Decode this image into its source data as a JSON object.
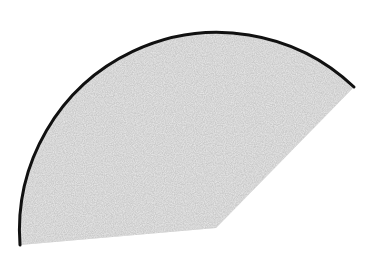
{
  "diagram": {
    "type": "circular-sector",
    "canvas": {
      "width": 378,
      "height": 263
    },
    "center": {
      "x": 216,
      "y": 228
    },
    "radius": 198,
    "arc_start": {
      "x": 20,
      "y": 245
    },
    "arc_end": {
      "x": 354,
      "y": 87
    },
    "fill_color": "#c9c9c9",
    "arc_stroke_color": "#111111",
    "arc_stroke_width": 3,
    "fill_texture": "noise"
  }
}
